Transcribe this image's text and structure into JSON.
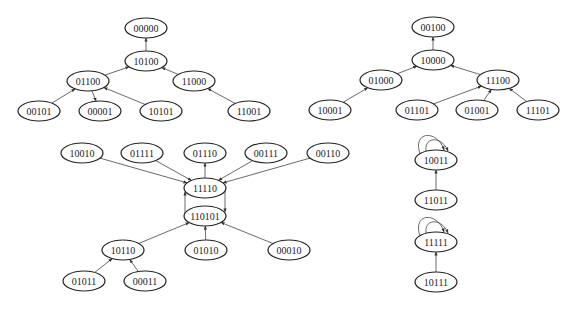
{
  "diagram": {
    "type": "state-transition-graph",
    "nodes": [
      {
        "id": "00000",
        "x": 146,
        "y": 28
      },
      {
        "id": "10100",
        "x": 146,
        "y": 61
      },
      {
        "id": "01100",
        "x": 88,
        "y": 81
      },
      {
        "id": "11000",
        "x": 194,
        "y": 81
      },
      {
        "id": "00101",
        "x": 39,
        "y": 111
      },
      {
        "id": "00001",
        "x": 100,
        "y": 111
      },
      {
        "id": "10101",
        "x": 161,
        "y": 111
      },
      {
        "id": "11001",
        "x": 249,
        "y": 111
      },
      {
        "id": "00100",
        "x": 433,
        "y": 27
      },
      {
        "id": "10000",
        "x": 433,
        "y": 60
      },
      {
        "id": "01000",
        "x": 381,
        "y": 80
      },
      {
        "id": "11100",
        "x": 498,
        "y": 80
      },
      {
        "id": "10001",
        "x": 330,
        "y": 110
      },
      {
        "id": "01101",
        "x": 417,
        "y": 110
      },
      {
        "id": "01001",
        "x": 477,
        "y": 110
      },
      {
        "id": "11101",
        "x": 538,
        "y": 110
      },
      {
        "id": "10010",
        "x": 82,
        "y": 153
      },
      {
        "id": "01111",
        "x": 142,
        "y": 153
      },
      {
        "id": "01110",
        "x": 205,
        "y": 153
      },
      {
        "id": "00111",
        "x": 266,
        "y": 153
      },
      {
        "id": "00110",
        "x": 328,
        "y": 153
      },
      {
        "id": "11110",
        "x": 205,
        "y": 188
      },
      {
        "id": "110101",
        "x": 205,
        "y": 216
      },
      {
        "id": "10110",
        "x": 123,
        "y": 250
      },
      {
        "id": "01010",
        "x": 206,
        "y": 250
      },
      {
        "id": "00010",
        "x": 289,
        "y": 250
      },
      {
        "id": "01011",
        "x": 84,
        "y": 281
      },
      {
        "id": "00011",
        "x": 145,
        "y": 281
      },
      {
        "id": "10011",
        "x": 436,
        "y": 160
      },
      {
        "id": "11011",
        "x": 436,
        "y": 200
      },
      {
        "id": "11111",
        "x": 436,
        "y": 242
      },
      {
        "id": "10111",
        "x": 436,
        "y": 282
      }
    ],
    "edges": [
      {
        "from": "10100",
        "to": "00000"
      },
      {
        "from": "01100",
        "to": "10100"
      },
      {
        "from": "11000",
        "to": "10100"
      },
      {
        "from": "00101",
        "to": "01100"
      },
      {
        "from": "01100",
        "to": "00001"
      },
      {
        "from": "10101",
        "to": "01100"
      },
      {
        "from": "11001",
        "to": "11000"
      },
      {
        "from": "10000",
        "to": "00100"
      },
      {
        "from": "01000",
        "to": "10000"
      },
      {
        "from": "11100",
        "to": "10000"
      },
      {
        "from": "10001",
        "to": "01000"
      },
      {
        "from": "01101",
        "to": "11100"
      },
      {
        "from": "01001",
        "to": "11100"
      },
      {
        "from": "11101",
        "to": "11100"
      },
      {
        "from": "10010",
        "to": "11110"
      },
      {
        "from": "01111",
        "to": "11110"
      },
      {
        "from": "11110",
        "to": "01110"
      },
      {
        "from": "00111",
        "to": "11110"
      },
      {
        "from": "00110",
        "to": "11110"
      },
      {
        "from": "11110",
        "to": "110101",
        "side": "right"
      },
      {
        "from": "110101",
        "to": "11110",
        "side": "left"
      },
      {
        "from": "10110",
        "to": "110101"
      },
      {
        "from": "01010",
        "to": "110101"
      },
      {
        "from": "00010",
        "to": "110101"
      },
      {
        "from": "01011",
        "to": "10110"
      },
      {
        "from": "00011",
        "to": "10110"
      },
      {
        "from": "10011",
        "to": "10011",
        "self": true
      },
      {
        "from": "11011",
        "to": "10011"
      },
      {
        "from": "11111",
        "to": "11111",
        "self": true
      },
      {
        "from": "10111",
        "to": "11111"
      }
    ]
  }
}
